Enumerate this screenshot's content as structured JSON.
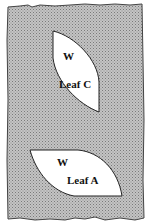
{
  "diagram": {
    "background": {
      "pattern": "stippled-gray",
      "fill": "#b8b8b8",
      "dot": "#8a8a8a",
      "border": "#444444"
    },
    "leaves": [
      {
        "id": "leaf-c",
        "mark": "W",
        "label": "Leaf C",
        "fill": "#ffffff"
      },
      {
        "id": "leaf-a",
        "mark": "W",
        "label": "Leaf A",
        "fill": "#ffffff"
      }
    ]
  }
}
